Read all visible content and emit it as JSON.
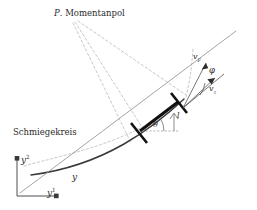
{
  "figure": {
    "type": "mechanics-diagram",
    "background": "#ffffff",
    "ink_color": "#2b2b2b",
    "dashed_color": "#b9b9bd",
    "thin_color": "#8d8d92",
    "bar_color": "#111111"
  },
  "labels": {
    "pole": {
      "symbol": "P",
      "text": "Momentanpol"
    },
    "osculating_circle": "Schmiegekreis",
    "curve": "y",
    "axis_x": {
      "base": "y",
      "sup": "1"
    },
    "axis_y": {
      "base": "y",
      "sup": "2"
    },
    "velocity_f": {
      "base": "v",
      "sub": "F"
    },
    "velocity_tau": {
      "base": "v",
      "sub": "τ"
    },
    "angle_phi": "φ",
    "angle_theta": "θ",
    "length": "l"
  },
  "geometry": {
    "pole_point": [
      72,
      18
    ],
    "bar_start": [
      137,
      133
    ],
    "bar_end": [
      180,
      100
    ],
    "origin": [
      17,
      196
    ],
    "axis_x_end": [
      59,
      196
    ],
    "axis_y_end": [
      17,
      157
    ]
  }
}
